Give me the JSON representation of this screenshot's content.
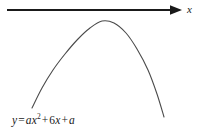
{
  "figure": {
    "background_color": "#ffffff",
    "width": 203,
    "height": 140
  },
  "axis": {
    "name": "x-axis",
    "label": "x",
    "color": "#1a1a1a",
    "line_start_x": 7,
    "line_end_x": 181,
    "line_y": 10,
    "thickness": 1.8,
    "arrowhead": "right-arrowhead"
  },
  "equation": {
    "full_text": "y = ax² + 6x + a",
    "lhs": "y",
    "equals": "=",
    "term1_coefficient": "a",
    "term1_variable": "x",
    "term1_exponent": "2",
    "term2_operator": "+",
    "term2_coefficient": "6",
    "term2_variable": "x",
    "term3_operator": "+",
    "term3_constant": "a",
    "color": "#1a1a1a"
  },
  "chart_data": {
    "type": "line",
    "title": "",
    "subtitle": "",
    "xlabel": "x",
    "ylabel": "",
    "grid": false,
    "legend": null,
    "annotations": [
      "y = ax² + 6x + a"
    ],
    "curve": {
      "name": "parabola",
      "equation": "y = ax^2 + 6x + a",
      "orientation": "opens-downward",
      "stroke_color": "#4a4a4a",
      "stroke_width": 1.1,
      "vertex_px": [
        102,
        21
      ],
      "left_endpoint_px": [
        32,
        108
      ],
      "right_endpoint_px": [
        164,
        117
      ],
      "x_px": [
        32,
        42,
        53,
        65,
        78,
        90,
        102,
        114,
        126,
        137,
        148,
        157,
        164
      ],
      "y_px": [
        108,
        88,
        70,
        54,
        39,
        28,
        21,
        23,
        33,
        49,
        70,
        94,
        117
      ]
    },
    "axis_line": {
      "name": "x-axis",
      "from_px": [
        7,
        10
      ],
      "to_px": [
        181,
        10
      ],
      "color": "#1a1a1a"
    },
    "xlim": [
      0,
      203
    ],
    "ylim": [
      140,
      0
    ]
  }
}
